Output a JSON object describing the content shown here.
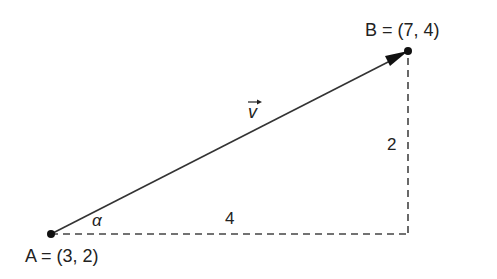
{
  "diagram": {
    "point_a": {
      "name": "A",
      "coords": "(3, 2)",
      "label": "A = (3, 2)"
    },
    "point_b": {
      "name": "B",
      "coords": "(7, 4)",
      "label": "B = (7, 4)"
    },
    "vector_label": "v",
    "angle_label": "α",
    "horizontal_leg_label": "4",
    "vertical_leg_label": "2",
    "colors": {
      "stroke": "#333333",
      "point": "#111111"
    }
  }
}
